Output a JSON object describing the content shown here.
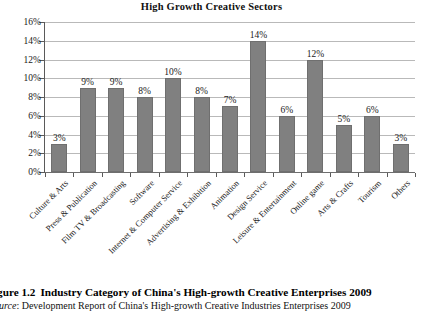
{
  "chart_data": {
    "type": "bar",
    "title": "High Growth Creative Sectors",
    "xlabel": "",
    "ylabel": "",
    "ylim": [
      0,
      16
    ],
    "ytick_step": 2,
    "grid": true,
    "legend": "none",
    "value_label_suffix": "%",
    "bar_color": "#808080",
    "categories": [
      "Culture & Arts",
      "Press & Publication",
      "Film TV & Broadcasting",
      "Software",
      "Internet & Computer Service",
      "Advertising & Exhibition",
      "Animation",
      "Design Service",
      "Leisure & Entertainment",
      "Online game",
      "Arts & Crafts",
      "Tourism",
      "Others"
    ],
    "values": [
      3,
      9,
      9,
      8,
      10,
      8,
      7,
      14,
      6,
      12,
      5,
      6,
      3
    ],
    "value_labels": [
      "3%",
      "9%",
      "9%",
      "8%",
      "10%",
      "8%",
      "7%",
      "14%",
      "6%",
      "12%",
      "5%",
      "6%",
      "3%"
    ],
    "ytick_labels": [
      "0%",
      "2%",
      "4%",
      "6%",
      "8%",
      "10%",
      "12%",
      "14%",
      "16%"
    ],
    "ytick_values": [
      0,
      2,
      4,
      6,
      8,
      10,
      12,
      14,
      16
    ]
  },
  "caption": {
    "figure_number": "igure 1.2",
    "figure_title": "Industry Category of China's High-growth Creative Enterprises 2009",
    "source_word": "ource",
    "source_separator": ": ",
    "source_text": "Development Report of China's High-growth Creative Industries Enterprises 2009"
  }
}
